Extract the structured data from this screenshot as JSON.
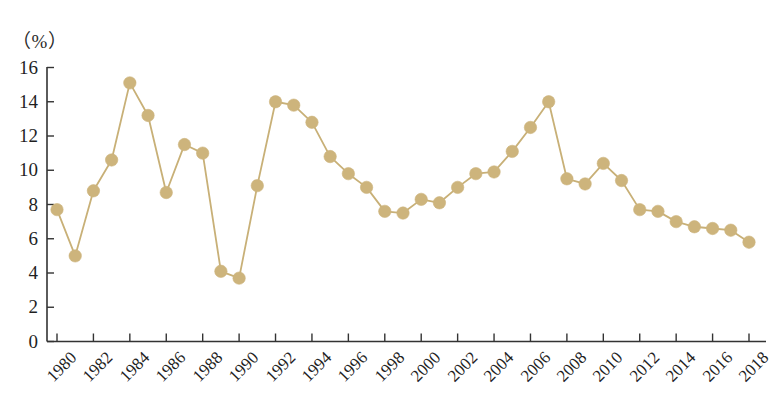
{
  "chart_data": {
    "type": "line",
    "title": "",
    "subtitle": "",
    "xlabel": "",
    "ylabel": "（%）",
    "unit_label": "（%）",
    "grid": false,
    "legend": null,
    "legend_position": "none",
    "series_color": "#c8b077",
    "marker_color": "#cdb47c",
    "axis_color": "#333333",
    "background_color": "#ffffff",
    "xlim": [
      1979.2,
      2018.8
    ],
    "ylim": [
      0,
      16
    ],
    "yticks": [
      0,
      2,
      4,
      6,
      8,
      10,
      12,
      14,
      16
    ],
    "ytick_labels": [
      "0",
      "2",
      "4",
      "6",
      "8",
      "10",
      "12",
      "14",
      "16"
    ],
    "xticks": [
      1980,
      1982,
      1984,
      1986,
      1988,
      1990,
      1992,
      1994,
      1996,
      1998,
      2000,
      2002,
      2004,
      2006,
      2008,
      2010,
      2012,
      2014,
      2016,
      2018
    ],
    "xtick_labels": [
      "1980",
      "1982",
      "1984",
      "1986",
      "1988",
      "1990",
      "1992",
      "1994",
      "1996",
      "1998",
      "2000",
      "2002",
      "2004",
      "2006",
      "2008",
      "2010",
      "2012",
      "2014",
      "2016",
      "2018"
    ],
    "x": [
      1980,
      1981,
      1982,
      1983,
      1984,
      1985,
      1986,
      1987,
      1988,
      1989,
      1990,
      1991,
      1992,
      1993,
      1994,
      1995,
      1996,
      1997,
      1998,
      1999,
      2000,
      2001,
      2002,
      2003,
      2004,
      2005,
      2006,
      2007,
      2008,
      2009,
      2010,
      2011,
      2012,
      2013,
      2014,
      2015,
      2016,
      2017,
      2018
    ],
    "values": [
      7.7,
      5.0,
      8.8,
      10.6,
      15.1,
      13.2,
      8.7,
      11.5,
      11.0,
      4.1,
      3.7,
      9.1,
      14.0,
      13.8,
      12.8,
      10.8,
      9.8,
      9.0,
      7.6,
      7.5,
      8.3,
      8.1,
      9.0,
      9.8,
      9.9,
      11.1,
      12.5,
      14.0,
      9.5,
      9.2,
      10.4,
      9.4,
      7.7,
      7.6,
      7.0,
      6.7,
      6.6,
      6.5,
      5.8
    ]
  }
}
